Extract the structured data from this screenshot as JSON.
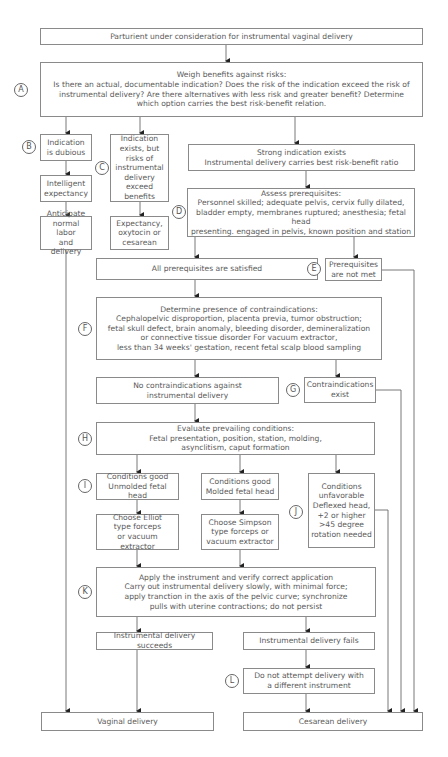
{
  "flowchart": {
    "start": "Parturient under consideration for instrumental vaginal delivery",
    "A": {
      "label": "A",
      "text": "Weigh benefits against risks:\nIs there an actual, documentable indication? Does the risk of the indication exceed the risk of\ninstrumental delivery? Are there alternatives with less risk and greater benefit? Determine\nwhich option carries the best risk-benefit relation."
    },
    "B": {
      "label": "B",
      "text": "Indication\nis dubious"
    },
    "B_next": "Intelligent\nexpectancy",
    "B_next2": "Anticipate\nnormal labor\nand delivery",
    "C": {
      "label": "C",
      "text": "Indication\nexists, but\nrisks of\ninstrumental\ndelivery exceed\nbenefits"
    },
    "C_next": "Expectancy,\noxytocin or\ncesarean",
    "strong": "Strong indication exists\nInstrumental delivery carries best risk-benefit ratio",
    "D": {
      "label": "D",
      "text": "Assess prerequisites:\nPersonnel skilled; adequate pelvis, cervix fully dilated,\nbladder empty, membranes ruptured; anesthesia; fetal head\npresenting. engaged in pelvis, known position and station"
    },
    "satisfied": "All prerequisites are satisfied",
    "E": {
      "label": "E",
      "text": "Prerequisites\nare not met"
    },
    "F": {
      "label": "F",
      "text": "Determine presence of contraindications:\nCephalopelvic disproportion, placenta previa, tumor obstruction;\nfetal skull defect, brain anomaly, bleeding disorder, demineralization\nor connective tissue disorder For vacuum extractor,\nless than 34 weeks' gestation, recent fetal scalp blood sampling"
    },
    "no_contra": "No contraindications against\ninstrumental delivery",
    "G": {
      "label": "G",
      "text": "Contraindications\nexist"
    },
    "H": {
      "label": "H",
      "text": "Evaluate prevailing conditions:\nFetal presentation, position, station, molding,\nasynclitism, caput formation"
    },
    "I": {
      "label": "I",
      "text": "Conditions good\nUnmolded fetal head"
    },
    "I2": "Conditions good\nMolded fetal head",
    "elliot": "Choose Elliot\ntype forceps\nor vacuum extractor",
    "simpson": "Choose Simpson\ntype forceps or\nvacuum extractor",
    "J": {
      "label": "J",
      "text": "Conditions\nunfavorable\nDeflexed head,\n+2 or higher\n>45 degree\nrotation needed"
    },
    "K": {
      "label": "K",
      "text": "Apply the instrument and verify correct application\nCarry out instrumental delivery slowly, with minimal force;\napply tranction in the axis of the pelvic curve; synchronize\npulls with uterine contractions; do not persist"
    },
    "succeeds": "Instrumental delivery succeeds",
    "fails": "Instrumental delivery fails",
    "L": {
      "label": "L",
      "text": "Do not attempt delivery with\na different instrument"
    },
    "vaginal": "Vaginal delivery",
    "cesarean": "Cesarean delivery"
  },
  "colors": {
    "line": "#6a6a6a",
    "text": "#5a5a5a",
    "border": "#8a8a8a"
  }
}
